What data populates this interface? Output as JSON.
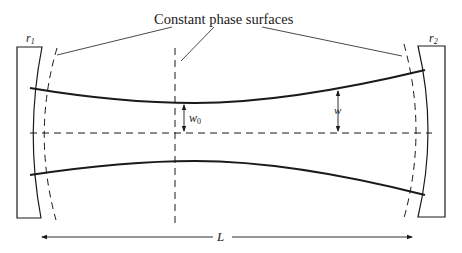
{
  "diagram": {
    "labels": {
      "phase_surfaces": "Constant phase surfaces",
      "mirror_left_radius": "r",
      "mirror_left_radius_sub": "1",
      "mirror_right_radius": "r",
      "mirror_right_radius_sub": "2",
      "waist_radius": "w",
      "waist_radius_sub": "0",
      "beam_radius": "w",
      "length": "L"
    },
    "colors": {
      "ink": "#1a1a1a",
      "background": "#ffffff"
    }
  }
}
